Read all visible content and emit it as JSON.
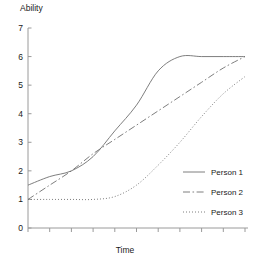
{
  "chart_data": {
    "type": "line",
    "title": "",
    "xlabel": "Time",
    "ylabel": "Ability",
    "xlim": [
      0,
      10
    ],
    "ylim": [
      0,
      7
    ],
    "yticks": [
      0,
      1,
      2,
      3,
      4,
      5,
      6,
      7
    ],
    "ytick_labels": [
      "0",
      "1",
      "2",
      "3",
      "4",
      "5",
      "6",
      "7"
    ],
    "xticks": [
      0,
      1,
      2,
      3,
      4,
      5,
      6,
      7,
      8,
      9,
      10
    ],
    "xtick_labels": [
      "",
      "",
      "",
      "",
      "",
      "",
      "",
      "",
      "",
      "",
      ""
    ],
    "grid": false,
    "legend_position": "center-right",
    "x": [
      0,
      1,
      2,
      3,
      4,
      5,
      6,
      7,
      8,
      9,
      10
    ],
    "series": [
      {
        "name": "Person 1",
        "linestyle": "solid",
        "color": "#6f6f6f",
        "values": [
          1.5,
          1.8,
          2.0,
          2.5,
          3.4,
          4.3,
          5.5,
          6.0,
          6.0,
          6.0,
          6.0
        ]
      },
      {
        "name": "Person 2",
        "linestyle": "dashdot",
        "color": "#6f6f6f",
        "values": [
          1.0,
          1.5,
          2.0,
          2.6,
          3.1,
          3.6,
          4.1,
          4.6,
          5.1,
          5.6,
          6.0
        ]
      },
      {
        "name": "Person 3",
        "linestyle": "dotted",
        "color": "#6f6f6f",
        "values": [
          1.0,
          1.0,
          1.0,
          1.0,
          1.1,
          1.5,
          2.2,
          3.0,
          3.9,
          4.7,
          5.3
        ]
      }
    ]
  },
  "axes": {
    "y_title": "Ability",
    "x_title": "Time"
  },
  "legend": {
    "entries": [
      {
        "label": "Person 1"
      },
      {
        "label": "Person 2"
      },
      {
        "label": "Person 3"
      }
    ]
  }
}
